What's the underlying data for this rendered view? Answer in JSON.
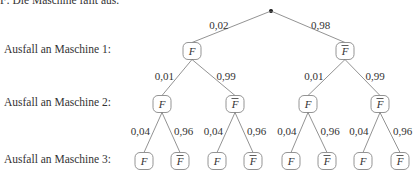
{
  "caption": "F: Die Maschine fällt aus.",
  "rows": [
    {
      "label": "Ausfall an Maschine 1:",
      "y": 51
    },
    {
      "label": "Ausfall an Maschine 2:",
      "y": 104
    },
    {
      "label": "Ausfall an Maschine 3:",
      "y": 161
    }
  ],
  "root": {
    "x": 271,
    "y": 11
  },
  "levels": [
    {
      "nodes": [
        {
          "x": 192,
          "label": "F",
          "bar": false
        },
        {
          "x": 345,
          "label": "F",
          "bar": true
        }
      ],
      "y": 51,
      "probs": [
        "0,02",
        "0,98"
      ]
    },
    {
      "nodes": [
        {
          "x": 162,
          "label": "F",
          "bar": false
        },
        {
          "x": 235,
          "label": "F",
          "bar": true
        },
        {
          "x": 308,
          "label": "F",
          "bar": false
        },
        {
          "x": 380,
          "label": "F",
          "bar": true
        }
      ],
      "y": 104,
      "probs": [
        "0,01",
        "0,99",
        "0,01",
        "0,99"
      ]
    },
    {
      "nodes": [
        {
          "x": 144,
          "label": "F",
          "bar": false
        },
        {
          "x": 180,
          "label": "F",
          "bar": true
        },
        {
          "x": 217,
          "label": "F",
          "bar": false
        },
        {
          "x": 253,
          "label": "F",
          "bar": true
        },
        {
          "x": 291,
          "label": "F",
          "bar": false
        },
        {
          "x": 327,
          "label": "F",
          "bar": true
        },
        {
          "x": 363,
          "label": "F",
          "bar": false
        },
        {
          "x": 400,
          "label": "F",
          "bar": true
        }
      ],
      "y": 161,
      "probs": [
        "0,04",
        "0,96",
        "0,04",
        "0,96",
        "0,04",
        "0,96",
        "0,04",
        "0,96"
      ]
    }
  ]
}
